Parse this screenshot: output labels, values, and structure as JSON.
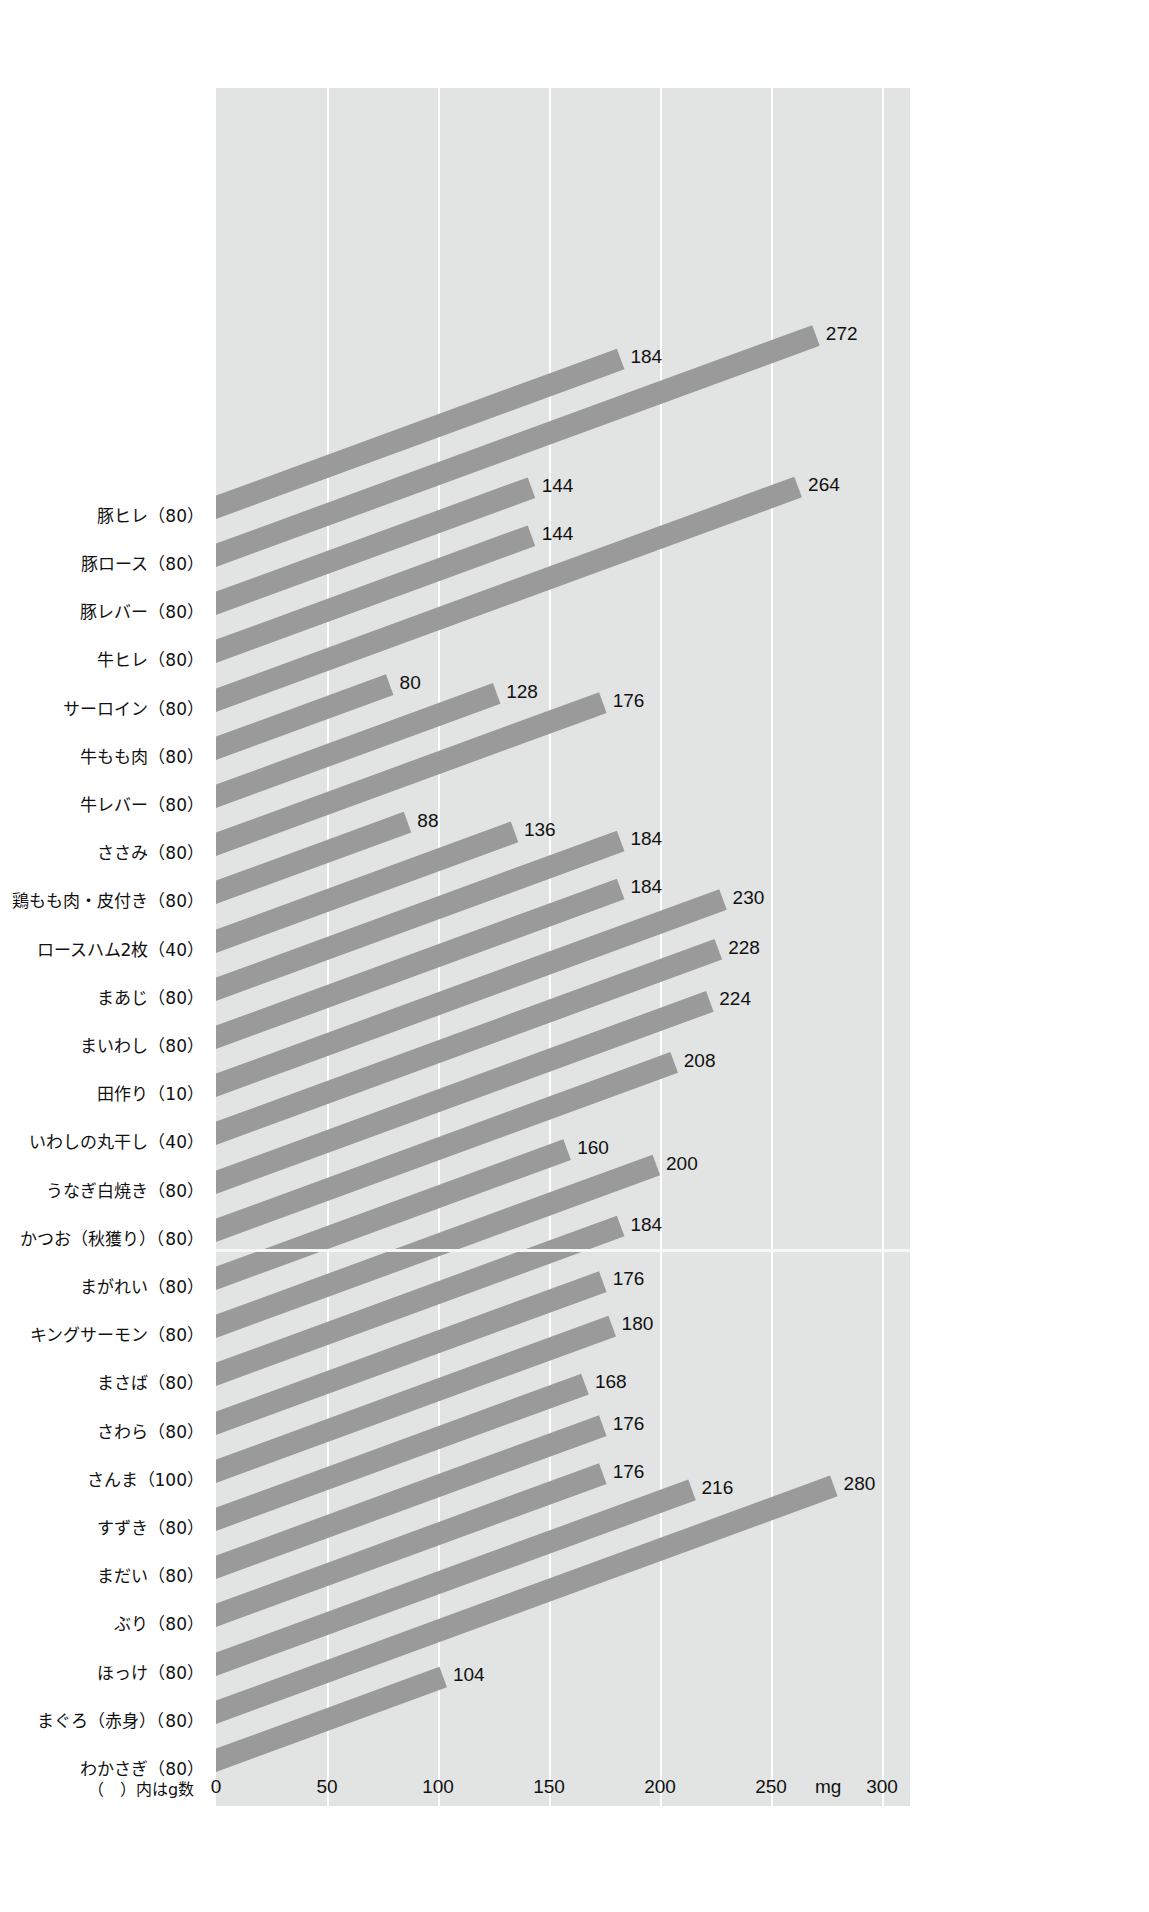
{
  "chart_data": {
    "type": "bar",
    "orientation": "horizontal-skewed",
    "title": "",
    "xlabel": "mg",
    "ylabel": "",
    "xlim": [
      0,
      300
    ],
    "xticks": [
      "0",
      "50",
      "100",
      "150",
      "200",
      "250",
      "300"
    ],
    "xtick_values": [
      0,
      50,
      100,
      150,
      200,
      250,
      300
    ],
    "unit": "mg",
    "grid": true,
    "legend": "none",
    "axis_note": "（　）内はg数",
    "bar_color": "#9a9a9a",
    "plot_bg_color": "#e2e4e3",
    "gridline_color": "#ffffff",
    "categories": [
      "豚ヒレ（80）",
      "豚ロース（80）",
      "豚レバー（80）",
      "牛ヒレ（80）",
      "サーロイン（80）",
      "牛もも肉（80）",
      "牛レバー（80）",
      "ささみ（80）",
      "鶏もも肉・皮付き（80）",
      "ロースハム2枚（40）",
      "まあじ（80）",
      "まいわし（80）",
      "田作り（10）",
      "いわしの丸干し（40）",
      "うなぎ白焼き（80）",
      "かつお（秋獲り）（80）",
      "まがれい（80）",
      "キングサーモン（80）",
      "まさば（80）",
      "さわら（80）",
      "さんま（100）",
      "すずき（80）",
      "まだい（80）",
      "ぶり（80）",
      "ほっけ（80）",
      "まぐろ（赤身）（80）",
      "わかさぎ（80）"
    ],
    "values": [
      184,
      272,
      144,
      144,
      264,
      80,
      128,
      176,
      88,
      136,
      184,
      184,
      230,
      228,
      224,
      208,
      160,
      200,
      184,
      176,
      180,
      168,
      176,
      176,
      216,
      280,
      104
    ],
    "value_labels": [
      "184",
      "272",
      "144",
      "144",
      "264",
      "80",
      "128",
      "176",
      "88",
      "136",
      "184",
      "184",
      "230",
      "228",
      "224",
      "208",
      "160",
      "200",
      "184",
      "176",
      "180",
      "168",
      "176",
      "176",
      "216",
      "280",
      "104"
    ]
  }
}
